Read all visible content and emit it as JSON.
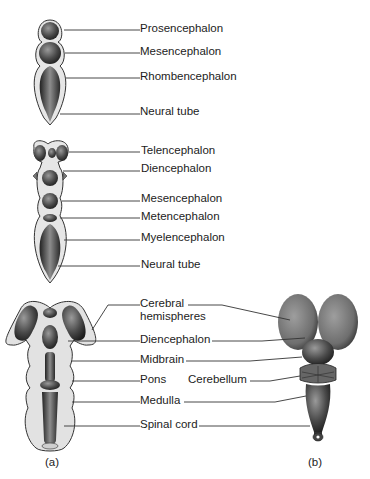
{
  "figure": {
    "stage1": {
      "labels": [
        "Prosencephalon",
        "Mesencephalon",
        "Rhombencephalon",
        "Neural tube"
      ]
    },
    "stage2": {
      "labels": [
        "Telencephalon",
        "Diencephalon",
        "Mesencephalon",
        "Metencephalon",
        "Myelencephalon",
        "Neural tube"
      ]
    },
    "stage3": {
      "labels": {
        "cerebral_1": "Cerebral",
        "cerebral_2": "hemispheres",
        "diencephalon": "Diencephalon",
        "midbrain": "Midbrain",
        "pons": "Pons",
        "cerebellum": "Cerebellum",
        "medulla": "Medulla",
        "spinal_cord": "Spinal cord"
      }
    },
    "panels": {
      "a": "(a)",
      "b": "(b)"
    }
  }
}
